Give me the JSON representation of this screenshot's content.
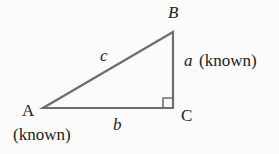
{
  "diagram": {
    "type": "right-triangle",
    "vertices": {
      "A": {
        "label": "A",
        "note": "(known)"
      },
      "B": {
        "label": "B"
      },
      "C": {
        "label": "C",
        "right_angle": true
      }
    },
    "sides": {
      "a": {
        "label": "a",
        "note": "(known)",
        "between": "B-C"
      },
      "b": {
        "label": "b",
        "between": "A-C"
      },
      "c": {
        "label": "c",
        "between": "A-B"
      }
    },
    "colors": {
      "stroke": "#6e6e6e",
      "text": "#222222",
      "background": "#fbfbfb"
    }
  }
}
